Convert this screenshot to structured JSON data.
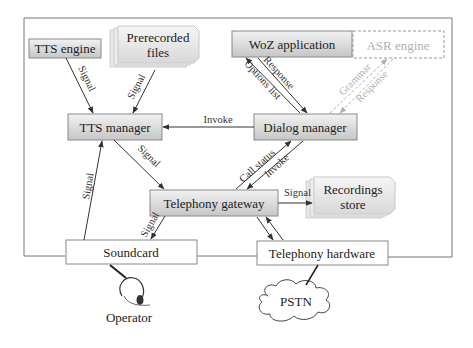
{
  "diagram": {
    "type": "architecture",
    "nodes": {
      "tts_engine": {
        "label": "TTS engine",
        "style": "shaded"
      },
      "prerecorded_files": {
        "label_line1": "Prerecorded",
        "label_line2": "files",
        "style": "stacked-document"
      },
      "woz_application": {
        "label": "WoZ application",
        "style": "shaded"
      },
      "asr_engine": {
        "label": "ASR engine",
        "style": "dashed-faded"
      },
      "tts_manager": {
        "label": "TTS manager",
        "style": "shaded"
      },
      "dialog_manager": {
        "label": "Dialog manager",
        "style": "shaded"
      },
      "telephony_gateway": {
        "label": "Telephony gateway",
        "style": "shaded"
      },
      "recordings_store": {
        "label_line1": "Recordings",
        "label_line2": "store",
        "style": "stacked-document"
      },
      "soundcard": {
        "label": "Soundcard",
        "style": "plain"
      },
      "telephony_hardware": {
        "label": "Telephony hardware",
        "style": "plain"
      },
      "pstn": {
        "label": "PSTN",
        "style": "cloud"
      },
      "operator": {
        "label": "Operator",
        "style": "headset-icon"
      }
    },
    "edges": {
      "tts_engine_signal": "Signal",
      "prerecorded_signal": "Signal",
      "invoke_tts": "Invoke",
      "response": "Response",
      "options_list": "Options list",
      "grammar": "Grammar",
      "asr_response": "Response",
      "tts_to_gateway_signal": "Signal",
      "call_status": "Call status",
      "invoke_gateway": "Invoke",
      "gateway_recordings_signal": "Signal",
      "gateway_soundcard_signal": "Signal",
      "soundcard_tts_signal": "Signal"
    },
    "colors": {
      "box_fill_top": "#eeeeee",
      "box_fill_bottom": "#c8c8c8",
      "border": "#6a6a6a",
      "line": "#333333",
      "faded": "#b0b0b0"
    }
  }
}
